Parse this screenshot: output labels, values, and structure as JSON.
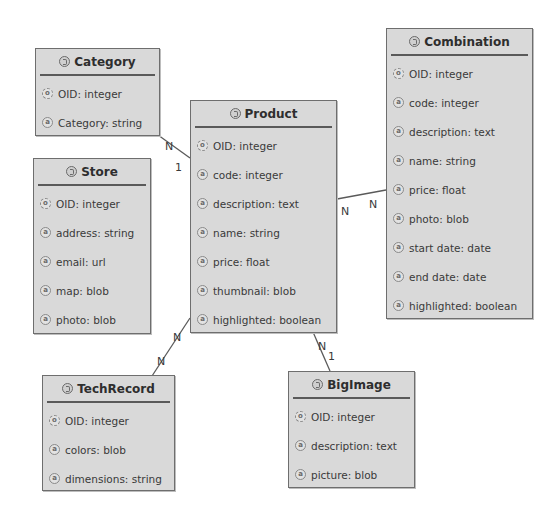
{
  "diagram": {
    "type": "entity-relationship",
    "entities": [
      {
        "id": "category",
        "name": "Category",
        "attributes": [
          {
            "label": "OID: integer",
            "key": true
          },
          {
            "label": "Category: string",
            "key": false
          }
        ]
      },
      {
        "id": "store",
        "name": "Store",
        "attributes": [
          {
            "label": "OID: integer",
            "key": true
          },
          {
            "label": "address: string",
            "key": false
          },
          {
            "label": "email: url",
            "key": false
          },
          {
            "label": "map: blob",
            "key": false
          },
          {
            "label": "photo: blob",
            "key": false
          }
        ]
      },
      {
        "id": "product",
        "name": "Product",
        "attributes": [
          {
            "label": "OID: integer",
            "key": true
          },
          {
            "label": "code: integer",
            "key": false
          },
          {
            "label": "description: text",
            "key": false
          },
          {
            "label": "name: string",
            "key": false
          },
          {
            "label": "price: float",
            "key": false
          },
          {
            "label": "thumbnail: blob",
            "key": false
          },
          {
            "label": "highlighted: boolean",
            "key": false
          }
        ]
      },
      {
        "id": "combination",
        "name": "Combination",
        "attributes": [
          {
            "label": "OID: integer",
            "key": true
          },
          {
            "label": "code: integer",
            "key": false
          },
          {
            "label": "description: text",
            "key": false
          },
          {
            "label": "name: string",
            "key": false
          },
          {
            "label": "price: float",
            "key": false
          },
          {
            "label": "photo: blob",
            "key": false
          },
          {
            "label": "start date: date",
            "key": false
          },
          {
            "label": "end date: date",
            "key": false
          },
          {
            "label": "highlighted: boolean",
            "key": false
          }
        ]
      },
      {
        "id": "techrecord",
        "name": "TechRecord",
        "attributes": [
          {
            "label": "OID: integer",
            "key": true
          },
          {
            "label": "colors: blob",
            "key": false
          },
          {
            "label": "dimensions: string",
            "key": false
          }
        ]
      },
      {
        "id": "bigimage",
        "name": "BigImage",
        "attributes": [
          {
            "label": "OID: integer",
            "key": true
          },
          {
            "label": "description: text",
            "key": false
          },
          {
            "label": "picture: blob",
            "key": false
          }
        ]
      }
    ],
    "relationships": [
      {
        "from": "Category",
        "to": "Product",
        "from_card": "N",
        "to_card": "1"
      },
      {
        "from": "Product",
        "to": "Combination",
        "from_card": "N",
        "to_card": "N"
      },
      {
        "from": "Product",
        "to": "TechRecord",
        "from_card": "N",
        "to_card": "N"
      },
      {
        "from": "Product",
        "to": "BigImage",
        "from_card": "N",
        "to_card": "1"
      }
    ],
    "attribute_icon_glyph": "a",
    "key_icon_glyph": "o",
    "colors": {
      "entity_fill": "#d9d9d9",
      "entity_border": "#6e6e6e",
      "text": "#2e2e2e",
      "edge": "#5a5a5a",
      "background": "#ffffff"
    }
  }
}
